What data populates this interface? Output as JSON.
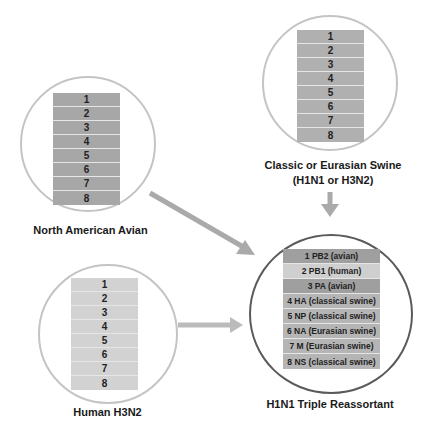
{
  "colors": {
    "avian_segment": "#a7a7a7",
    "swine_segment": "#b0b0b0",
    "human_segment": "#d2d2d2",
    "source_circle_border": "#c4c4c4",
    "result_circle_border": "#5a5a5a",
    "arrow": "#aaaaaa"
  },
  "sources": [
    {
      "id": "north-american-avian",
      "label": "North American Avian",
      "segments": [
        "1",
        "2",
        "3",
        "4",
        "5",
        "6",
        "7",
        "8"
      ]
    },
    {
      "id": "classic-eurasian-swine",
      "label_line1": "Classic or Eurasian Swine",
      "label_line2": "(H1N1 or H3N2)",
      "segments": [
        "1",
        "2",
        "3",
        "4",
        "5",
        "6",
        "7",
        "8"
      ]
    },
    {
      "id": "human-h3n2",
      "label": "Human H3N2",
      "segments": [
        "1",
        "2",
        "3",
        "4",
        "5",
        "6",
        "7",
        "8"
      ]
    }
  ],
  "result": {
    "label": "H1N1 Triple Reassortant",
    "segments": [
      {
        "text": "1 PB2 (avian)",
        "origin": "avian"
      },
      {
        "text": "2 PB1 (human)",
        "origin": "human"
      },
      {
        "text": "3 PA (avian)",
        "origin": "avian"
      },
      {
        "text": "4 HA (classical swine)",
        "origin": "swine"
      },
      {
        "text": "5 NP (classical swine)",
        "origin": "swine"
      },
      {
        "text": "6 NA (Eurasian swine)",
        "origin": "swine"
      },
      {
        "text": "7 M (Eurasian swine)",
        "origin": "swine"
      },
      {
        "text": "8 NS (classical swine)",
        "origin": "swine"
      }
    ]
  },
  "arrows": [
    {
      "from": "north-american-avian",
      "to": "result"
    },
    {
      "from": "classic-eurasian-swine",
      "to": "result"
    },
    {
      "from": "human-h3n2",
      "to": "result"
    }
  ]
}
